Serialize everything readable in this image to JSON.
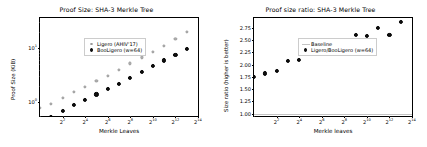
{
  "chart_data": [
    {
      "type": "scatter",
      "title": "Proof Size: SHA-3 Merkle Tree",
      "xlabel": "Merkle Leaves",
      "ylabel": "Proof Size (KiB)",
      "xscale": "log2",
      "yscale": "log10",
      "grid": false,
      "legend_position": "upper left",
      "xlim": [
        1,
        15
      ],
      "ylim_log10": [
        -0.25,
        1.55
      ],
      "xticks": [
        "2",
        "2",
        "2",
        "2",
        "2",
        "2",
        "2"
      ],
      "xtick_exponents": [
        "2",
        "4",
        "6",
        "8",
        "10",
        "12",
        "14"
      ],
      "yticks": [
        "10",
        "10"
      ],
      "ytick_exponents": [
        "0",
        "1"
      ],
      "x": [
        1,
        2,
        3,
        4,
        5,
        6,
        7,
        8,
        9,
        10,
        11,
        12,
        13,
        14
      ],
      "series": [
        {
          "name": "Ligero (AHIV'17)",
          "color": "#b8b8b8",
          "values": [
            0.79,
            0.95,
            1.22,
            1.55,
            1.95,
            2.45,
            3.1,
            4.0,
            5.2,
            6.7,
            8.6,
            11.0,
            14.5,
            19.5
          ]
        },
        {
          "name": "BooLigero (w=64)",
          "color": "#111111",
          "values": [
            0.45,
            0.55,
            0.7,
            0.9,
            1.12,
            1.4,
            1.75,
            2.2,
            2.8,
            3.6,
            4.6,
            5.9,
            7.5,
            9.7
          ]
        }
      ]
    },
    {
      "type": "scatter",
      "title": "Proof size ratio: SHA-3 Merkle Tree",
      "xlabel": "Merkle leaves",
      "ylabel": "Size ratio (higher is better)",
      "xscale": "log2",
      "yscale": "linear",
      "grid": false,
      "legend_position": "upper left",
      "xlim": [
        1,
        15
      ],
      "ylim": [
        0.95,
        2.95
      ],
      "xticks": [
        "2",
        "2",
        "2",
        "2",
        "2",
        "2",
        "2"
      ],
      "xtick_exponents": [
        "2",
        "4",
        "6",
        "8",
        "10",
        "12",
        "14"
      ],
      "yticks": [
        "1.00",
        "1.25",
        "1.50",
        "1.75",
        "2.00",
        "2.25",
        "2.50",
        "2.75"
      ],
      "baseline_label": "Baseline",
      "baseline_value": 1.0,
      "baseline_color": "#c4c4c4",
      "x": [
        1,
        2,
        3,
        4,
        5,
        6,
        7,
        8,
        9,
        10,
        11,
        12,
        13,
        14
      ],
      "series": [
        {
          "name": "Ligero/BooLigero (w=64)",
          "color": "#111111",
          "values": [
            1.74,
            1.82,
            1.87,
            2.07,
            2.1,
            2.3,
            2.28,
            2.47,
            2.43,
            2.61,
            2.58,
            2.75,
            2.61,
            2.87
          ]
        }
      ]
    }
  ]
}
